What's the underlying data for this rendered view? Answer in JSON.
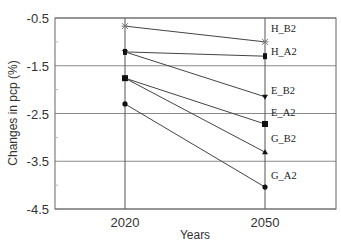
{
  "chart_data": {
    "type": "line",
    "title": "",
    "xlabel": "Years",
    "ylabel": "Changes in pcp (%)",
    "categories": [
      "2020",
      "2050"
    ],
    "ylim": [
      -4.5,
      -0.5
    ],
    "yticks": [
      "-0.5",
      "-1.5",
      "-2.5",
      "-3.5",
      "-4.5"
    ],
    "grid": true,
    "legend_position": "inline-right",
    "series": [
      {
        "name": "H_B2",
        "marker": "star",
        "values": [
          -0.67,
          -1.0
        ]
      },
      {
        "name": "H_A2",
        "marker": "bar",
        "values": [
          -1.21,
          -1.3
        ]
      },
      {
        "name": "E_B2",
        "marker": "triangle-down",
        "values": [
          -1.21,
          -2.15
        ]
      },
      {
        "name": "E_A2",
        "marker": "square",
        "values": [
          -1.76,
          -2.72
        ]
      },
      {
        "name": "G_B2",
        "marker": "triangle-up",
        "values": [
          -1.76,
          -3.31
        ]
      },
      {
        "name": "G_A2",
        "marker": "circle",
        "values": [
          -2.3,
          -4.04
        ]
      }
    ]
  }
}
